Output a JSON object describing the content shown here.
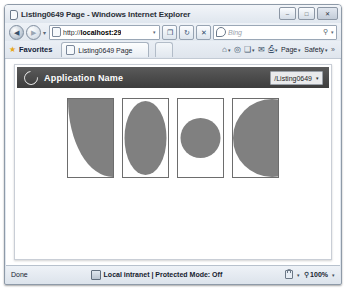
{
  "browser": {
    "title": "Listing0649 Page - Windows Internet Explorer",
    "title_icon": "page-icon",
    "window_controls": {
      "minimize": "–",
      "maximize": "□",
      "close": "✕"
    },
    "navigation": {
      "back_icon": "◀",
      "forward_icon": "▶",
      "recent_pages_caret": "▾",
      "refresh_icon": "↻",
      "stop_icon": "✕",
      "compat_icon": "❐"
    },
    "address": {
      "url_prefix": "http://",
      "url_host": "localhost:29",
      "url_full": "http://localhost:29",
      "dropdown_caret": "▾",
      "site_icon": "page-icon"
    },
    "search": {
      "provider": "Bing",
      "placeholder": "Bing",
      "magnifier_icon": "⚲",
      "caret": "▾"
    },
    "favorites_bar": {
      "star_icon": "★",
      "label": "Favorites"
    },
    "tab": {
      "label": "Listing0649 Page",
      "icon": "page-icon"
    },
    "command_bar": {
      "items": [
        {
          "name": "home",
          "glyph": "⌂",
          "label": "",
          "caret": "▾"
        },
        {
          "name": "feeds",
          "glyph": "◎",
          "label": "",
          "caret": ""
        },
        {
          "name": "read-mail",
          "glyph": "❑",
          "label": "",
          "caret": "▾"
        },
        {
          "name": "print",
          "glyph": "✉",
          "label": "",
          "caret": ""
        },
        {
          "name": "page-tools",
          "glyph": "⎙",
          "label": "",
          "caret": "▾"
        },
        {
          "name": "page-menu",
          "glyph": "",
          "label": "Page",
          "caret": "▾"
        },
        {
          "name": "safety-menu",
          "glyph": "",
          "label": "Safety",
          "caret": "▾"
        }
      ],
      "overflow": "»"
    },
    "status": {
      "text": "Done",
      "zone": "Local intranet | Protected Mode: Off",
      "zone_icon": "network-icon",
      "privacy_icon": "lock-icon",
      "privacy_caret": "▾",
      "zoom_icon": "⚲",
      "zoom_level": "100%",
      "zoom_caret": "▾"
    }
  },
  "page": {
    "header": {
      "logo_icon": "swirl-logo",
      "app_name": "Application Name",
      "path_selector": {
        "value": "/Listing0649",
        "caret": "▾"
      }
    },
    "colors": {
      "shape_fill": "#808080",
      "shape_border": "#6d6d6d",
      "header_background": "#4a4a4a",
      "header_text": "#ffffff",
      "page_background": "#ffffff"
    },
    "shapes": [
      {
        "name": "quarter-ellipse-bottom-left",
        "description": "Ellipse anchored at top-right corner filling lower-left area",
        "kind": "ellipse",
        "cx": 45,
        "cy": 0,
        "rx": 45,
        "ry": 78
      },
      {
        "name": "full-ellipse",
        "description": "Ellipse inscribed in the box",
        "kind": "ellipse",
        "cx": 22.5,
        "cy": 39,
        "rx": 21,
        "ry": 37
      },
      {
        "name": "circle-fit-width",
        "description": "Circle with diameter equal to box width, vertically centered",
        "kind": "circle",
        "cx": 22.5,
        "cy": 39,
        "r": 20
      },
      {
        "name": "large-circle-clipped-right",
        "description": "Large circle overflowing the right edge of the box",
        "kind": "circle",
        "cx": 39,
        "cy": 39,
        "r": 39
      }
    ]
  }
}
